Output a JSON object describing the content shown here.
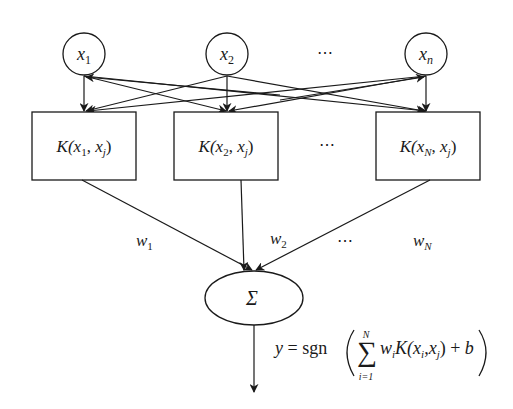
{
  "diagram": {
    "type": "svm-network",
    "colors": {
      "stroke": "#1a1a1a",
      "background": "#ffffff"
    },
    "inputs": [
      {
        "id": "x1",
        "base": "x",
        "sub": "1"
      },
      {
        "id": "x2",
        "base": "x",
        "sub": "2"
      },
      {
        "id": "xn",
        "base": "x",
        "sub": "n"
      }
    ],
    "input_ellipsis": "⋯",
    "kernels": [
      {
        "id": "k1",
        "prefix": "K(",
        "a": "x",
        "a_sub": "1",
        "sep": ", ",
        "b": "x",
        "b_sub": "j",
        "suffix": ")"
      },
      {
        "id": "k2",
        "prefix": "K(",
        "a": "x",
        "a_sub": "2",
        "sep": ", ",
        "b": "x",
        "b_sub": "j",
        "suffix": ")"
      },
      {
        "id": "kN",
        "prefix": "K(",
        "a": "x",
        "a_sub": "N",
        "sep": ", ",
        "b": "x",
        "b_sub": "j",
        "suffix": ")"
      }
    ],
    "kernel_ellipsis": "⋯",
    "weights": [
      {
        "id": "w1",
        "base": "w",
        "sub": "1"
      },
      {
        "id": "w2",
        "base": "w",
        "sub": "2"
      },
      {
        "id": "wN",
        "base": "w",
        "sub": "N"
      }
    ],
    "weight_ellipsis": "⋯",
    "sum_node": {
      "symbol": "Σ"
    },
    "output_formula": {
      "lhs": "y",
      "eq": " = sgn",
      "sum_symbol": "∑",
      "sum_upper": "N",
      "sum_lower": "i=1",
      "term_w": "w",
      "term_w_sub": "i",
      "term_K": "K(",
      "term_x1": "x",
      "term_x1_sub": "i",
      "term_comma": ",",
      "term_x2": "x",
      "term_x2_sub": "j",
      "term_close": ")",
      "plus": " + ",
      "bias": "b"
    }
  }
}
